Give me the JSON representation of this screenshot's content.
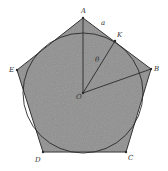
{
  "diagram": {
    "title": "",
    "shape": "regular pentagon with inscribed circle",
    "colors": {
      "fill": "#8f8f8f",
      "stroke": "#2a2a2a",
      "background": "#ffffff"
    },
    "vertices": [
      {
        "label": "A",
        "x": 83,
        "y": 18
      },
      {
        "label": "B",
        "x": 151,
        "y": 69
      },
      {
        "label": "C",
        "x": 126,
        "y": 152
      },
      {
        "label": "D",
        "x": 43,
        "y": 152
      },
      {
        "label": "E",
        "x": 17,
        "y": 70
      }
    ],
    "center": {
      "label": "O",
      "x": 83,
      "y": 93
    },
    "tangent_point": {
      "label": "K",
      "x": 115,
      "y": 41
    },
    "side_label": "a",
    "angle_label": "θ",
    "circle_radius": 60
  }
}
